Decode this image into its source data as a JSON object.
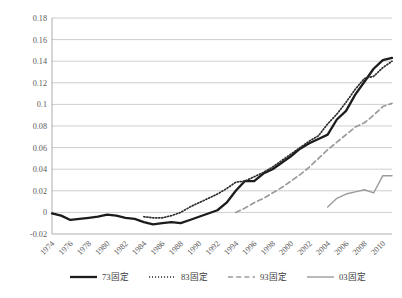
{
  "chart_data": {
    "type": "line",
    "title": "",
    "subtitle": "",
    "xlabel": "",
    "ylabel": "",
    "xlim": [
      1974,
      2011
    ],
    "ylim": [
      -0.02,
      0.18
    ],
    "yticks": [
      -0.02,
      0,
      0.02,
      0.04,
      0.06,
      0.08,
      0.1,
      0.12,
      0.14,
      0.16,
      0.18
    ],
    "ytick_labels": [
      "-0.02",
      "0",
      "0.02",
      "0.04",
      "0.06",
      "0.08",
      "0.1",
      "0.12",
      "0.14",
      "0.16",
      "0.18"
    ],
    "xticks": [
      1974,
      1976,
      1978,
      1980,
      1982,
      1984,
      1986,
      1988,
      1990,
      1992,
      1994,
      1996,
      1998,
      2000,
      2002,
      2004,
      2006,
      2008,
      2010
    ],
    "xtick_labels": [
      "1974",
      "1976",
      "1978",
      "1980",
      "1982",
      "1984",
      "1986",
      "1988",
      "1990",
      "1992",
      "1994",
      "1996",
      "1998",
      "2000",
      "2002",
      "2004",
      "2006",
      "2008",
      "2010"
    ],
    "grid": true,
    "legend_position": "bottom",
    "series": [
      {
        "name": "73固定",
        "style": "solid-thick",
        "color": "#1c1c1c",
        "x": [
          1974,
          1975,
          1976,
          1977,
          1978,
          1979,
          1980,
          1981,
          1982,
          1983,
          1984,
          1985,
          1986,
          1987,
          1988,
          1989,
          1990,
          1991,
          1992,
          1993,
          1994,
          1995,
          1996,
          1997,
          1998,
          1999,
          2000,
          2001,
          2002,
          2003,
          2004,
          2005,
          2006,
          2007,
          2008,
          2009,
          2010,
          2011
        ],
        "values": [
          -0.001,
          -0.003,
          -0.007,
          -0.006,
          -0.005,
          -0.004,
          -0.002,
          -0.003,
          -0.005,
          -0.006,
          -0.009,
          -0.011,
          -0.01,
          -0.009,
          -0.01,
          -0.007,
          -0.004,
          -0.001,
          0.002,
          0.009,
          0.02,
          0.029,
          0.029,
          0.036,
          0.04,
          0.046,
          0.052,
          0.059,
          0.064,
          0.068,
          0.072,
          0.086,
          0.094,
          0.109,
          0.121,
          0.133,
          0.141,
          0.143
        ]
      },
      {
        "name": "83固定",
        "style": "dotted",
        "color": "#2b2b2b",
        "x": [
          1984,
          1985,
          1986,
          1987,
          1988,
          1989,
          1990,
          1991,
          1992,
          1993,
          1994,
          1995,
          1996,
          1997,
          1998,
          1999,
          2000,
          2001,
          2002,
          2003,
          2004,
          2005,
          2006,
          2007,
          2008,
          2009,
          2010,
          2011
        ],
        "values": [
          -0.004,
          -0.005,
          -0.005,
          -0.003,
          0.0,
          0.005,
          0.009,
          0.013,
          0.017,
          0.022,
          0.028,
          0.029,
          0.033,
          0.037,
          0.042,
          0.048,
          0.054,
          0.06,
          0.066,
          0.071,
          0.082,
          0.091,
          0.102,
          0.114,
          0.124,
          0.126,
          0.134,
          0.14
        ]
      },
      {
        "name": "93固定",
        "style": "dashed",
        "color": "#9b9b9b",
        "x": [
          1994,
          1995,
          1996,
          1997,
          1998,
          1999,
          2000,
          2001,
          2002,
          2003,
          2004,
          2005,
          2006,
          2007,
          2008,
          2009,
          2010,
          2011
        ],
        "values": [
          0.0,
          0.004,
          0.009,
          0.013,
          0.018,
          0.023,
          0.029,
          0.035,
          0.042,
          0.05,
          0.058,
          0.065,
          0.072,
          0.079,
          0.083,
          0.09,
          0.098,
          0.101
        ]
      },
      {
        "name": "03固定",
        "style": "solid-thin",
        "color": "#9b9b9b",
        "x": [
          2004,
          2005,
          2006,
          2007,
          2008,
          2009,
          2010,
          2011
        ],
        "values": [
          0.005,
          0.013,
          0.017,
          0.019,
          0.021,
          0.018,
          0.034,
          0.034
        ]
      }
    ]
  },
  "legend": {
    "items": [
      {
        "label": "73固定",
        "style": "solid-thick",
        "color": "#1c1c1c"
      },
      {
        "label": "83固定",
        "style": "dotted",
        "color": "#2b2b2b"
      },
      {
        "label": "93固定",
        "style": "dashed",
        "color": "#9b9b9b"
      },
      {
        "label": "03固定",
        "style": "solid-thin",
        "color": "#9b9b9b"
      }
    ]
  }
}
